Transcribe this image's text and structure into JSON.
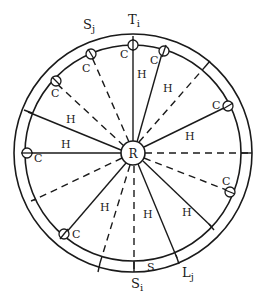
{
  "diagram": {
    "center_label": "R",
    "outer_labels": {
      "top": {
        "main": "T",
        "sub": "i"
      },
      "top_left": {
        "main": "S",
        "sub": "j"
      },
      "bottom": {
        "main": "S",
        "sub": "i"
      },
      "bottom_right": {
        "main": "L",
        "sub": "j"
      },
      "ring_gap": "S"
    },
    "sector_label": "H",
    "node_label": "C",
    "colors": {
      "stroke": "#1a1a1a",
      "background": "#ffffff"
    }
  }
}
